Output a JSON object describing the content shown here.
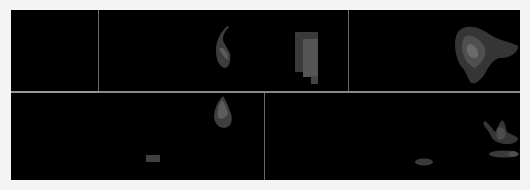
{
  "figure": {
    "background": "#f4f4f4",
    "canvas_color": "#000000",
    "divider_color": "#8a8a8a",
    "layout": {
      "rows": 2,
      "top_row_panels": 3,
      "bottom_row_panels": 3
    },
    "panels": [
      {
        "id": "top-left",
        "row": 0,
        "shapes": []
      },
      {
        "id": "top-middle",
        "row": 0,
        "shapes": [
          "hook-blob",
          "stepped-rectangle-blob"
        ]
      },
      {
        "id": "top-right",
        "row": 0,
        "shapes": [
          "large-irregular-blob"
        ]
      },
      {
        "id": "bottom-left",
        "row": 1,
        "shapes": [
          "teardrop-blob",
          "small-rectangle-blob"
        ]
      },
      {
        "id": "bottom-middle",
        "row": 1,
        "shapes": []
      },
      {
        "id": "bottom-right",
        "row": 1,
        "shapes": [
          "v-shaped-blob",
          "elongated-ellipse-blob",
          "small-ellipse-blob"
        ]
      }
    ]
  }
}
